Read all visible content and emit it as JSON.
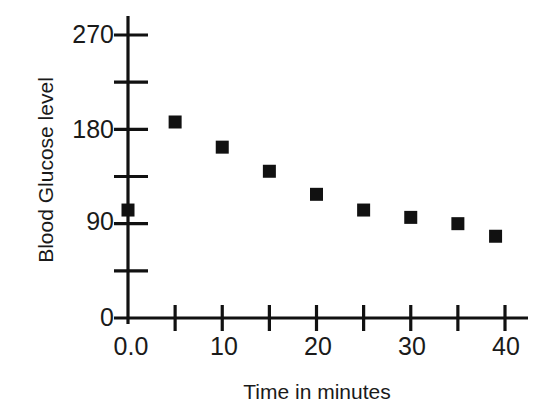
{
  "chart_data": {
    "type": "scatter",
    "title": "",
    "xlabel": "Time in minutes",
    "ylabel": "Blood Glucose level",
    "xlim": [
      0,
      40
    ],
    "ylim": [
      0,
      285
    ],
    "grid": false,
    "legend": null,
    "marker": "filled-square",
    "marker_color": "#111111",
    "x": [
      0,
      5,
      10,
      15,
      20,
      25,
      30,
      35,
      39
    ],
    "values": [
      103,
      187,
      163,
      140,
      118,
      103,
      96,
      90,
      78
    ],
    "points": [
      {
        "x": 0,
        "y": 103
      },
      {
        "x": 5,
        "y": 187
      },
      {
        "x": 10,
        "y": 163
      },
      {
        "x": 15,
        "y": 140
      },
      {
        "x": 20,
        "y": 118
      },
      {
        "x": 25,
        "y": 103
      },
      {
        "x": 30,
        "y": 96
      },
      {
        "x": 35,
        "y": 90
      },
      {
        "x": 39,
        "y": 78
      }
    ],
    "x_ticks": [
      0,
      5,
      10,
      15,
      20,
      25,
      30,
      35,
      40
    ],
    "x_tick_labels": [
      {
        "value": 0,
        "label": "0.0"
      },
      {
        "value": 10,
        "label": "10"
      },
      {
        "value": 20,
        "label": "20"
      },
      {
        "value": 30,
        "label": "30"
      },
      {
        "value": 40,
        "label": "40"
      }
    ],
    "y_ticks_major": [
      0,
      90,
      180,
      270
    ],
    "y_ticks_minor": [
      45,
      135,
      225
    ],
    "y_tick_labels": [
      {
        "value": 0,
        "label": "0"
      },
      {
        "value": 90,
        "label": "90"
      },
      {
        "value": 180,
        "label": "180"
      },
      {
        "value": 270,
        "label": "270"
      }
    ],
    "axis_color": "#111111",
    "background_color": "#ffffff"
  },
  "axes": {
    "y_title": "Blood Glucose level",
    "x_title": "Time in minutes"
  },
  "labels": {
    "y0": "0",
    "y90": "90",
    "y180": "180",
    "y270": "270",
    "x0": "0.0",
    "x10": "10",
    "x20": "20",
    "x30": "30",
    "x40": "40"
  }
}
